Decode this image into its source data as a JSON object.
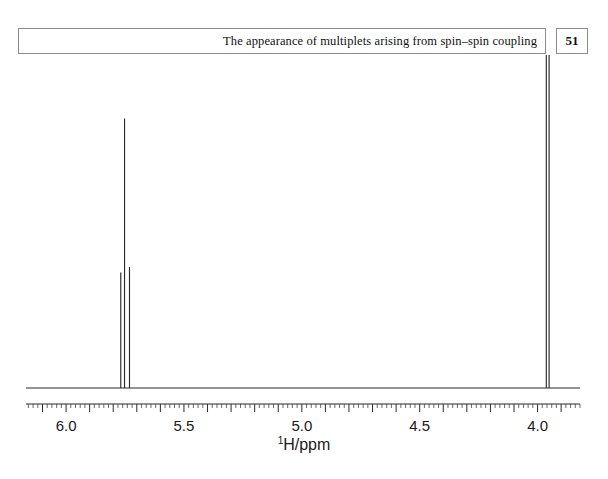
{
  "header": {
    "title": "The appearance of multiplets arising from spin–spin coupling",
    "page_number": "51"
  },
  "axis_caption": {
    "nucleus": "1",
    "unit": "H/ppm"
  },
  "chart_data": {
    "type": "line",
    "title": "",
    "subtitle": "",
    "xlabel": "1H/ppm",
    "ylabel": "",
    "xlim": [
      6.17,
      3.82
    ],
    "ylim": [
      0,
      1
    ],
    "x_reversed": true,
    "grid": false,
    "legend": null,
    "tick_labels": [
      "6.0",
      "5.5",
      "5.0",
      "4.5",
      "4.0"
    ],
    "tick_values": [
      6.0,
      5.5,
      5.0,
      4.5,
      4.0
    ],
    "minor_tick_step": 0.02,
    "major_tick_step": 0.1,
    "baseline_level": 0,
    "annotations": [],
    "peaks": [
      {
        "label": "left-multiplet-line-1",
        "ppm": 5.768,
        "intensity": 0.42
      },
      {
        "label": "left-multiplet-line-2",
        "ppm": 5.752,
        "intensity": 0.98
      },
      {
        "label": "left-multiplet-line-3",
        "ppm": 5.731,
        "intensity": 0.44
      },
      {
        "label": "right-doublet-line-1",
        "ppm": 3.963,
        "intensity": 1.49
      },
      {
        "label": "right-doublet-line-2",
        "ppm": 3.951,
        "intensity": 1.47
      }
    ],
    "multiplets": [
      {
        "name": "left-multiplet",
        "center_ppm": 5.752,
        "line_count": 3,
        "pattern": "triplet-like"
      },
      {
        "name": "right-multiplet",
        "center_ppm": 3.957,
        "line_count": 2,
        "pattern": "doublet"
      }
    ],
    "colors": {
      "trace": "#2b2b2b",
      "axis": "#2b2b2b",
      "background": "#ffffff"
    }
  }
}
